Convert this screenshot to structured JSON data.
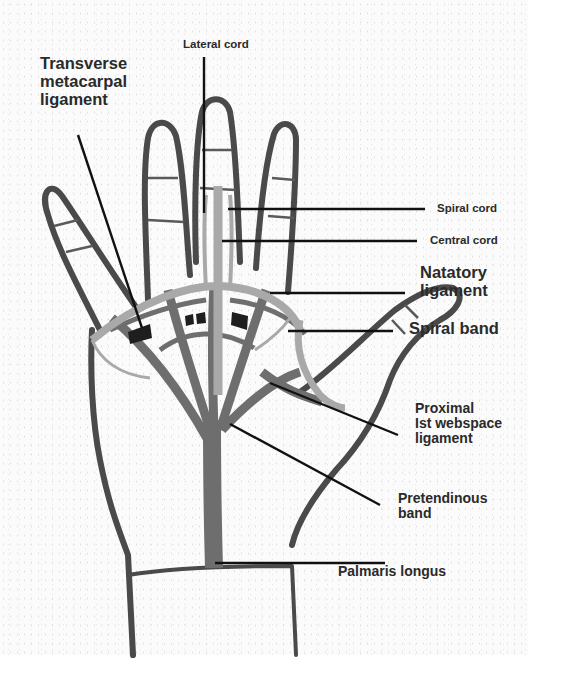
{
  "figure": {
    "colors": {
      "outline": "#4a4a4a",
      "dark_band": "#6e6e6e",
      "light_band": "#a9a9a9",
      "ligament_black": "#1e1e1e",
      "leader_line": "#111111",
      "label_text": "#2a2a2a"
    }
  },
  "labels": {
    "transverse_metacarpal_ligament": "Transverse\nmetacarpal\nligament",
    "lateral_cord": "Lateral cord",
    "spiral_cord": "Spiral cord",
    "central_cord": "Central cord",
    "natatory_ligament": "Natatory\nligament",
    "spiral_band": "Spiral band",
    "proximal_1st_webspace_ligament": "Proximal\nIst webspace\nligament",
    "pretendinous_band": "Pretendinous\nband",
    "palmaris_longus": "Palmaris longus"
  }
}
